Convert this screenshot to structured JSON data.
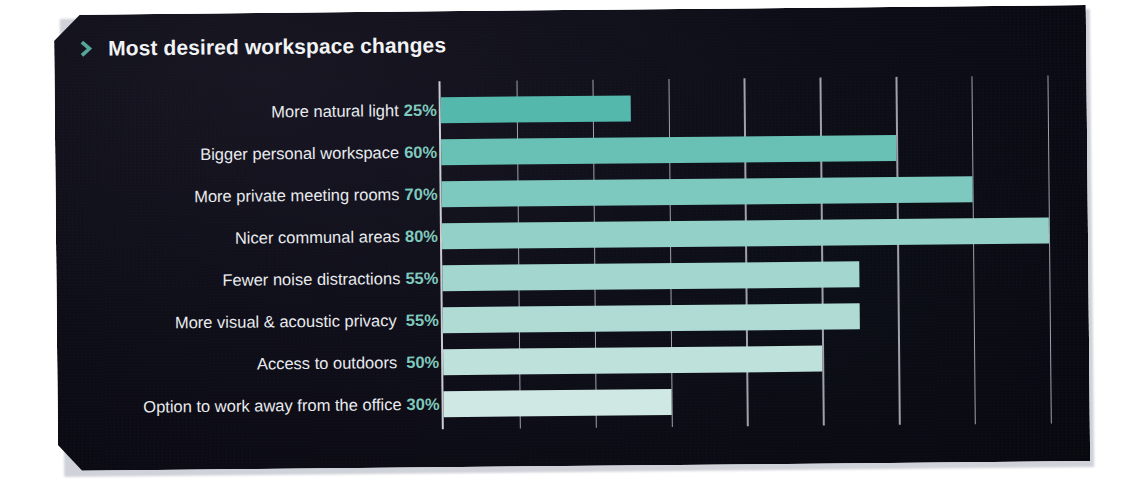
{
  "header": {
    "title": "Most desired workspace changes",
    "chevron_icon": "chevron-right-icon"
  },
  "colors": {
    "card_background": "#0d0d15",
    "page_background": "#ffffff",
    "title_text": "#f2f3f5",
    "label_text": "#e9ebee",
    "accent_teal": "#7fc9bd",
    "gridline": "#b9bcc4",
    "axis": "#c9ccd2"
  },
  "chart_data": {
    "type": "bar",
    "orientation": "horizontal",
    "title": "Most desired workspace changes",
    "xlabel": "",
    "ylabel": "",
    "xlim": [
      0,
      82
    ],
    "grid": true,
    "gridline_step": 10,
    "legend": "none",
    "value_suffix": "%",
    "categories": [
      "More natural light",
      "Bigger personal workspace",
      "More private meeting rooms",
      "Nicer communal areas",
      "Fewer noise distractions",
      "More visual & acoustic privacy",
      "Access to outdoors",
      "Option to work away from the office"
    ],
    "values": [
      25,
      60,
      70,
      80,
      55,
      55,
      50,
      30
    ],
    "value_labels": [
      "25%",
      "60%",
      "70%",
      "80%",
      "55%",
      "55%",
      "50%",
      "30%"
    ],
    "bar_colors": [
      "#54b8ad",
      "#69c1b6",
      "#7ec9bf",
      "#93d0c8",
      "#a3d6cf",
      "#b0dbd5",
      "#bfe1dc",
      "#cfe8e4"
    ],
    "extra_space_before_value": [
      false,
      false,
      false,
      false,
      false,
      true,
      true,
      false
    ]
  }
}
